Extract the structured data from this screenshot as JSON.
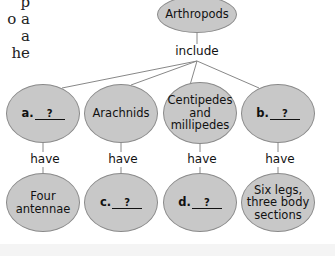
{
  "page_fragment": {
    "lines": [
      "p",
      "o a",
      "a",
      "he"
    ]
  },
  "diagram": {
    "root": {
      "label": "Arthropods"
    },
    "root_link": "include",
    "groups": [
      {
        "name": {
          "letter": "a.",
          "blank": "?"
        },
        "link": "have",
        "trait": {
          "label": "Four antennae"
        }
      },
      {
        "name": {
          "label": "Arachnids"
        },
        "link": "have",
        "trait": {
          "letter": "c.",
          "blank": "?"
        }
      },
      {
        "name": {
          "label": "Centipedes and millipedes"
        },
        "link": "have",
        "trait": {
          "letter": "d.",
          "blank": "?"
        }
      },
      {
        "name": {
          "letter": "b.",
          "blank": "?"
        },
        "link": "have",
        "trait": {
          "label": "Six legs, three body sections"
        }
      }
    ]
  },
  "colors": {
    "node_fill": "#c8c8c8",
    "node_border": "#8a8a8a",
    "line": "#888888",
    "text": "#111111"
  }
}
